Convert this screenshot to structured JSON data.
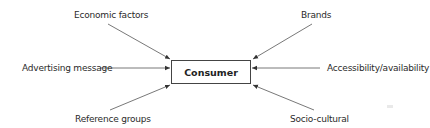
{
  "diagram": {
    "type": "influence-diagram",
    "center": {
      "label": "Consumer"
    },
    "factors": [
      {
        "id": "economic",
        "label": "Economic factors",
        "position": "top-left"
      },
      {
        "id": "brands",
        "label": "Brands",
        "position": "top-right"
      },
      {
        "id": "advertising",
        "label": "Advertising message",
        "position": "left"
      },
      {
        "id": "accessibility",
        "label": "Accessibility/availability",
        "position": "right"
      },
      {
        "id": "reference",
        "label": "Reference groups",
        "position": "bottom-left"
      },
      {
        "id": "socio",
        "label": "Socio-cultural",
        "position": "bottom-right"
      }
    ],
    "arrow_direction": "inward-to-center",
    "colors": {
      "line": "#444444",
      "text": "#2a2a2a",
      "background": "#ffffff"
    }
  }
}
